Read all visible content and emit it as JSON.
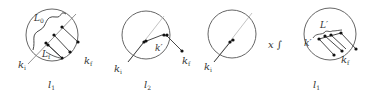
{
  "figure": {
    "panels": [
      {
        "id": "panel1",
        "bottom_label": {
          "main": "l",
          "sub": "1"
        },
        "labels": {
          "k_i": {
            "main": "k",
            "sub": "i"
          },
          "k_f": {
            "main": "k",
            "sub": "f"
          },
          "L_0": {
            "main": "L",
            "sub": "0"
          },
          "L_f": {
            "main": "L",
            "sub": "f"
          }
        }
      },
      {
        "id": "panel2",
        "bottom_label": {
          "main": "l",
          "sub": "2"
        },
        "labels": {
          "k_i": {
            "main": "k",
            "sub": "i"
          },
          "k_f": {
            "main": "k",
            "sub": "f"
          },
          "k_prime": "k′"
        }
      },
      {
        "id": "panel3",
        "bottom_label": null,
        "labels": {
          "k_i": {
            "main": "k",
            "sub": "i"
          }
        },
        "operator": "x ∫"
      },
      {
        "id": "panel4",
        "bottom_label": {
          "main": "l",
          "sub": "1"
        },
        "labels": {
          "k_prime": "k′",
          "k_f": {
            "main": "k",
            "sub": "f"
          },
          "L_prime": "L′"
        }
      }
    ],
    "colors": {
      "stroke": "#555555",
      "dot": "#111111",
      "text": "#333333",
      "light_line": "#aaaaaa"
    }
  }
}
